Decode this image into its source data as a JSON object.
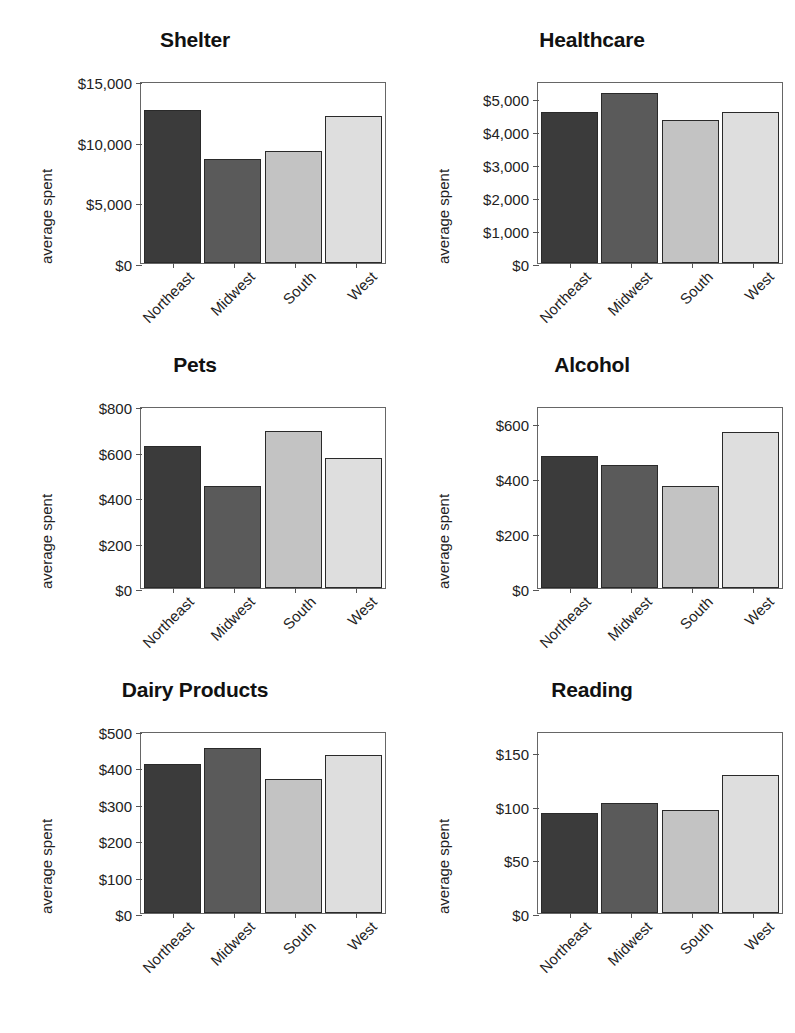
{
  "figure": {
    "common_ylabel": "average spent",
    "categories": [
      "Northeast",
      "Midwest",
      "South",
      "West"
    ],
    "series_colors": [
      "#3b3b3b",
      "#5a5a5a",
      "#c3c3c3",
      "#dedede"
    ],
    "panel_count": 6,
    "caption_partial": ""
  },
  "chart_data": [
    {
      "type": "bar",
      "title": "Shelter",
      "xlabel": "",
      "ylabel": "average spent",
      "categories": [
        "Northeast",
        "Midwest",
        "South",
        "West"
      ],
      "values": [
        12650,
        8600,
        9250,
        12150
      ],
      "ylim": [
        0,
        15000
      ],
      "yticks": [
        0,
        5000,
        10000,
        15000
      ],
      "ytick_labels": [
        "$0",
        "$5,000",
        "$10,000",
        "$15,000"
      ],
      "grid": false,
      "legend": "none"
    },
    {
      "type": "bar",
      "title": "Healthcare",
      "xlabel": "",
      "ylabel": "average spent",
      "categories": [
        "Northeast",
        "Midwest",
        "South",
        "West"
      ],
      "values": [
        4550,
        5150,
        4330,
        4570
      ],
      "ylim": [
        0,
        5500
      ],
      "yticks": [
        0,
        1000,
        2000,
        3000,
        4000,
        5000
      ],
      "ytick_labels": [
        "$0",
        "$1,000",
        "$2,000",
        "$3,000",
        "$4,000",
        "$5,000"
      ],
      "grid": false,
      "legend": "none"
    },
    {
      "type": "bar",
      "title": "Pets",
      "xlabel": "",
      "ylabel": "average spent",
      "categories": [
        "Northeast",
        "Midwest",
        "South",
        "West"
      ],
      "values": [
        625,
        447,
        688,
        572
      ],
      "ylim": [
        0,
        800
      ],
      "yticks": [
        0,
        200,
        400,
        600,
        800
      ],
      "ytick_labels": [
        "$0",
        "$200",
        "$400",
        "$600",
        "$800"
      ],
      "grid": false,
      "legend": "none"
    },
    {
      "type": "bar",
      "title": "Alcohol",
      "xlabel": "",
      "ylabel": "average spent",
      "categories": [
        "Northeast",
        "Midwest",
        "South",
        "West"
      ],
      "values": [
        478,
        445,
        370,
        565
      ],
      "ylim": [
        0,
        660
      ],
      "yticks": [
        0,
        200,
        400,
        600
      ],
      "ytick_labels": [
        "$0",
        "$200",
        "$400",
        "$600"
      ],
      "grid": false,
      "legend": "none"
    },
    {
      "type": "bar",
      "title": "Dairy Products",
      "xlabel": "",
      "ylabel": "average spent",
      "categories": [
        "Northeast",
        "Midwest",
        "South",
        "West"
      ],
      "values": [
        410,
        452,
        367,
        435
      ],
      "ylim": [
        0,
        500
      ],
      "yticks": [
        0,
        100,
        200,
        300,
        400,
        500
      ],
      "ytick_labels": [
        "$0",
        "$100",
        "$200",
        "$300",
        "$400",
        "$500"
      ],
      "grid": false,
      "legend": "none"
    },
    {
      "type": "bar",
      "title": "Reading",
      "xlabel": "",
      "ylabel": "average spent",
      "categories": [
        "Northeast",
        "Midwest",
        "South",
        "West"
      ],
      "values": [
        93,
        103,
        96,
        129
      ],
      "ylim": [
        0,
        170
      ],
      "yticks": [
        0,
        50,
        100,
        150
      ],
      "ytick_labels": [
        "$0",
        "$50",
        "$100",
        "$150"
      ],
      "grid": false,
      "legend": "none"
    }
  ]
}
